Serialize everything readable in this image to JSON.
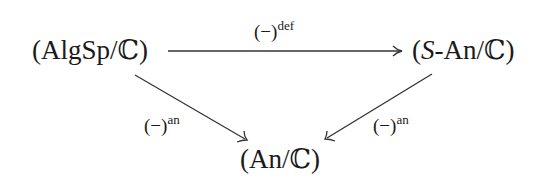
{
  "diagram": {
    "type": "commutative-diagram",
    "nodes": {
      "algsp": {
        "open": "(",
        "text": "AlgSp/ℂ",
        "close": ")"
      },
      "san": {
        "open": "(",
        "italic": "S",
        "text": "-An/ℂ",
        "close": ")"
      },
      "an": {
        "open": "(",
        "text": "An/ℂ",
        "close": ")"
      }
    },
    "edges": {
      "top": {
        "from": "AlgSp/ℂ",
        "to": "S-An/ℂ",
        "base": "(−)",
        "sup": "def"
      },
      "left": {
        "from": "AlgSp/ℂ",
        "to": "An/ℂ",
        "base": "(−)",
        "sup": "an"
      },
      "right": {
        "from": "S-An/ℂ",
        "to": "An/ℂ",
        "base": "(−)",
        "sup": "an"
      }
    },
    "colors": {
      "stroke": "#333333",
      "text": "#1a1a1a"
    }
  }
}
